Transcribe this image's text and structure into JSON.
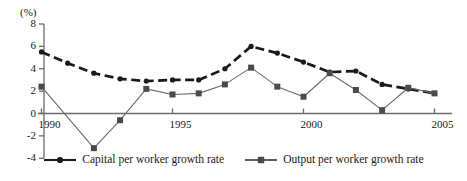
{
  "chart_data": {
    "type": "line",
    "title": "",
    "xlabel": "",
    "ylabel": "(%)",
    "ylim": [
      -4,
      8
    ],
    "xlim": [
      1989,
      2005.6
    ],
    "yticks": [
      8,
      6,
      4,
      2,
      0,
      -2,
      -4
    ],
    "xticks": [
      1990,
      1995,
      2000,
      2005
    ],
    "grid": false,
    "legend_position": "bottom-center",
    "x": [
      1990,
      1991,
      1992,
      1993,
      1994,
      1995,
      1996,
      1997,
      1998,
      1999,
      2000,
      2001,
      2002,
      2003,
      2004,
      2005
    ],
    "series": [
      {
        "name": "Capital per worker growth rate",
        "marker": "circle",
        "linestyle": "dashed",
        "color": "#1a1a1a",
        "values": [
          5.5,
          4.5,
          3.6,
          3.1,
          2.9,
          3.0,
          3.0,
          4.0,
          6.0,
          5.4,
          4.6,
          3.7,
          3.8,
          2.6,
          2.2,
          1.8
        ]
      },
      {
        "name": "Output per worker growth rate",
        "marker": "square",
        "linestyle": "solid",
        "color": "#555555",
        "values": [
          2.4,
          null,
          -3.1,
          -0.6,
          2.2,
          1.7,
          1.8,
          2.6,
          4.1,
          2.4,
          1.5,
          3.6,
          2.1,
          0.3,
          2.3,
          1.8
        ]
      }
    ]
  },
  "axis": {
    "unit_label": "(%)",
    "y_tick_labels": [
      "8",
      "6",
      "4",
      "2",
      "0",
      "-2",
      "-4"
    ],
    "x_tick_labels": [
      "1990",
      "1995",
      "2000",
      "2005"
    ]
  },
  "legend": {
    "entries": [
      {
        "label": "Capital per worker growth rate",
        "marker": "circle-marker-icon"
      },
      {
        "label": "Output per worker growth rate",
        "marker": "square-marker-icon"
      }
    ]
  }
}
